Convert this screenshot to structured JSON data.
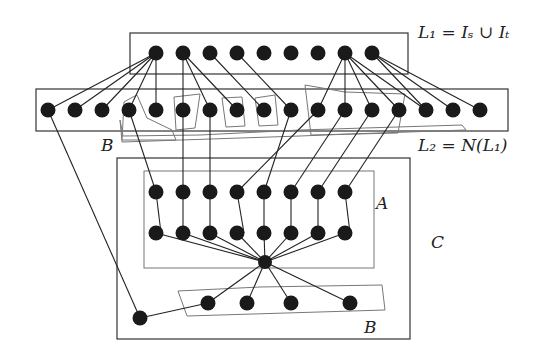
{
  "labels": {
    "L1": "L₁ = Iₛ ∪ Iₜ",
    "L2": "L₂ = N(L₁)",
    "A": "A",
    "B_top": "B",
    "B_bottom": "B",
    "C": "C"
  },
  "nodes": {
    "L1": [
      [
        156,
        53
      ],
      [
        183,
        53
      ],
      [
        210,
        53
      ],
      [
        237,
        53
      ],
      [
        264,
        53
      ],
      [
        291,
        53
      ],
      [
        318,
        53
      ],
      [
        345,
        53
      ],
      [
        372,
        53
      ]
    ],
    "L2": [
      [
        48,
        110
      ],
      [
        75,
        110
      ],
      [
        102,
        110
      ],
      [
        129,
        110
      ],
      [
        156,
        110
      ],
      [
        183,
        110
      ],
      [
        210,
        110
      ],
      [
        237,
        110
      ],
      [
        264,
        110
      ],
      [
        291,
        110
      ],
      [
        318,
        110
      ],
      [
        345,
        110
      ],
      [
        372,
        110
      ],
      [
        399,
        110
      ],
      [
        426,
        110
      ],
      [
        453,
        110
      ],
      [
        480,
        110
      ]
    ],
    "A_top": [
      [
        156,
        192
      ],
      [
        183,
        192
      ],
      [
        210,
        192
      ],
      [
        237,
        192
      ],
      [
        264,
        192
      ],
      [
        291,
        192
      ],
      [
        318,
        192
      ],
      [
        345,
        192
      ]
    ],
    "A_bottom": [
      [
        156,
        233
      ],
      [
        183,
        233
      ],
      [
        210,
        233
      ],
      [
        237,
        233
      ],
      [
        264,
        233
      ],
      [
        291,
        233
      ],
      [
        318,
        233
      ],
      [
        345,
        233
      ]
    ],
    "hub": [
      [
        265,
        262
      ]
    ],
    "B_bottom": [
      [
        208,
        303
      ],
      [
        247,
        303
      ],
      [
        291,
        303
      ],
      [
        350,
        303
      ]
    ],
    "lone": [
      [
        140,
        318
      ]
    ]
  },
  "edges": [
    [
      [
        156,
        53
      ],
      [
        48,
        110
      ]
    ],
    [
      [
        156,
        53
      ],
      [
        75,
        110
      ]
    ],
    [
      [
        156,
        53
      ],
      [
        102,
        110
      ]
    ],
    [
      [
        156,
        53
      ],
      [
        129,
        110
      ]
    ],
    [
      [
        156,
        53
      ],
      [
        156,
        110
      ]
    ],
    [
      [
        183,
        53
      ],
      [
        183,
        110
      ]
    ],
    [
      [
        183,
        53
      ],
      [
        210,
        110
      ]
    ],
    [
      [
        183,
        53
      ],
      [
        237,
        110
      ]
    ],
    [
      [
        210,
        53
      ],
      [
        264,
        110
      ]
    ],
    [
      [
        237,
        53
      ],
      [
        291,
        110
      ]
    ],
    [
      [
        345,
        53
      ],
      [
        318,
        110
      ]
    ],
    [
      [
        345,
        53
      ],
      [
        345,
        110
      ]
    ],
    [
      [
        345,
        53
      ],
      [
        372,
        110
      ]
    ],
    [
      [
        345,
        53
      ],
      [
        399,
        110
      ]
    ],
    [
      [
        345,
        53
      ],
      [
        426,
        110
      ]
    ],
    [
      [
        372,
        53
      ],
      [
        426,
        110
      ]
    ],
    [
      [
        372,
        53
      ],
      [
        453,
        110
      ]
    ],
    [
      [
        372,
        53
      ],
      [
        480,
        110
      ]
    ],
    [
      [
        48,
        110
      ],
      [
        140,
        318
      ]
    ],
    [
      [
        129,
        110
      ],
      [
        156,
        192
      ]
    ],
    [
      [
        183,
        110
      ],
      [
        183,
        192
      ]
    ],
    [
      [
        210,
        110
      ],
      [
        210,
        192
      ]
    ],
    [
      [
        318,
        110
      ],
      [
        237,
        192
      ]
    ],
    [
      [
        291,
        110
      ],
      [
        264,
        192
      ]
    ],
    [
      [
        345,
        110
      ],
      [
        291,
        192
      ]
    ],
    [
      [
        372,
        110
      ],
      [
        318,
        192
      ]
    ],
    [
      [
        399,
        110
      ],
      [
        345,
        192
      ]
    ],
    [
      [
        156,
        192
      ],
      [
        161,
        233
      ]
    ],
    [
      [
        183,
        192
      ],
      [
        183,
        233
      ]
    ],
    [
      [
        210,
        192
      ],
      [
        210,
        233
      ]
    ],
    [
      [
        237,
        192
      ],
      [
        244,
        233
      ]
    ],
    [
      [
        264,
        192
      ],
      [
        264,
        233
      ]
    ],
    [
      [
        291,
        192
      ],
      [
        291,
        233
      ]
    ],
    [
      [
        318,
        192
      ],
      [
        318,
        233
      ]
    ],
    [
      [
        345,
        192
      ],
      [
        350,
        233
      ]
    ],
    [
      [
        156,
        233
      ],
      [
        265,
        262
      ]
    ],
    [
      [
        183,
        233
      ],
      [
        265,
        262
      ]
    ],
    [
      [
        210,
        233
      ],
      [
        265,
        262
      ]
    ],
    [
      [
        237,
        233
      ],
      [
        265,
        262
      ]
    ],
    [
      [
        264,
        233
      ],
      [
        265,
        262
      ]
    ],
    [
      [
        291,
        233
      ],
      [
        265,
        262
      ]
    ],
    [
      [
        318,
        233
      ],
      [
        265,
        262
      ]
    ],
    [
      [
        345,
        233
      ],
      [
        265,
        262
      ]
    ],
    [
      [
        265,
        262
      ],
      [
        208,
        303
      ]
    ],
    [
      [
        265,
        262
      ],
      [
        247,
        303
      ]
    ],
    [
      [
        265,
        262
      ],
      [
        291,
        303
      ]
    ],
    [
      [
        265,
        262
      ],
      [
        350,
        303
      ]
    ],
    [
      [
        140,
        318
      ],
      [
        208,
        303
      ]
    ]
  ]
}
